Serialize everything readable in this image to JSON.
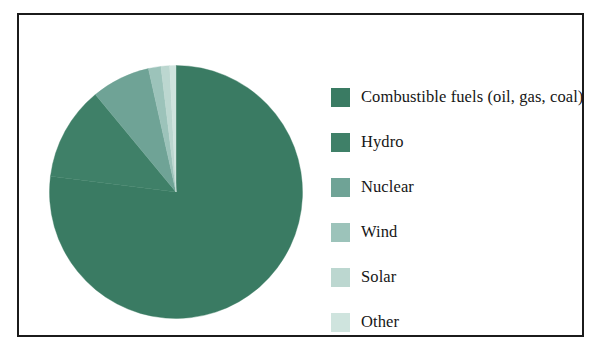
{
  "figure": {
    "title": "",
    "background_color": "#ffffff",
    "border_color": "#1b1b1b"
  },
  "chart_data": {
    "type": "pie",
    "title": "",
    "xlabel": "",
    "ylabel": "",
    "legend_position": "right",
    "grid": false,
    "start_angle_deg": 0,
    "direction": "clockwise",
    "categories": [
      "Combustible fuels (oil, gas, coal)",
      "Hydro",
      "Nuclear",
      "Wind",
      "Solar",
      "Other"
    ],
    "values": [
      77.0,
      12.0,
      7.5,
      1.6,
      1.1,
      0.8
    ],
    "colors": [
      "#3a7b63",
      "#3f8068",
      "#6fa396",
      "#9cc3ba",
      "#bcd7d0",
      "#cfe4de"
    ],
    "slices": [
      {
        "label": "Combustible fuels (oil, gas, coal)",
        "value": 77.0,
        "color": "#3a7b63"
      },
      {
        "label": "Hydro",
        "value": 12.0,
        "color": "#3f8068"
      },
      {
        "label": "Nuclear",
        "value": 7.5,
        "color": "#6fa396"
      },
      {
        "label": "Wind",
        "value": 1.6,
        "color": "#9cc3ba"
      },
      {
        "label": "Solar",
        "value": 1.1,
        "color": "#bcd7d0"
      },
      {
        "label": "Other",
        "value": 0.8,
        "color": "#cfe4de"
      }
    ]
  },
  "legend": {
    "items": [
      {
        "label": "Combustible fuels (oil, gas, coal)",
        "color": "#3a7b63"
      },
      {
        "label": "Hydro",
        "color": "#3f8068"
      },
      {
        "label": "Nuclear",
        "color": "#6fa396"
      },
      {
        "label": "Wind",
        "color": "#9cc3ba"
      },
      {
        "label": "Solar",
        "color": "#bcd7d0"
      },
      {
        "label": "Other",
        "color": "#cfe4de"
      }
    ]
  }
}
